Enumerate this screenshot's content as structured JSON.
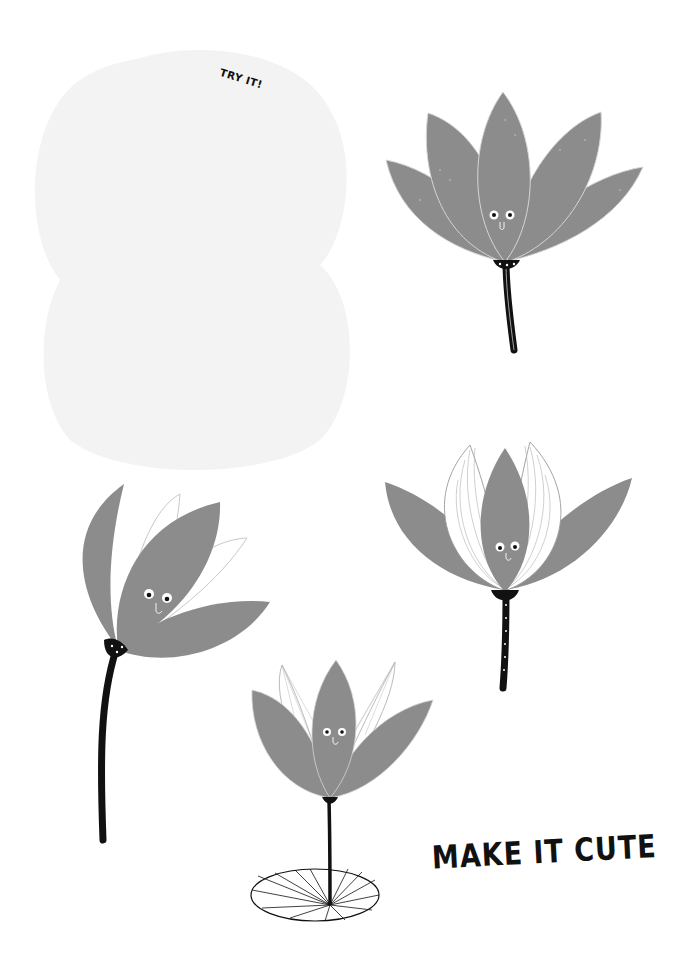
{
  "page": {
    "practice_area": {
      "label": "TRY IT!"
    },
    "caption": "MAKE IT CUTE",
    "colors": {
      "petal": "#8c8c8c",
      "petal_outline": "#d6d6d6",
      "ink": "#111111",
      "practice_fill": "#f3f3f3",
      "background": "#ffffff"
    },
    "flowers": [
      {
        "name": "open-lotus",
        "style": "fully open, six grey petals, smooth black stem"
      },
      {
        "name": "tilted-bud-lotus",
        "style": "tilted bud, white outlined petals, curved black stem"
      },
      {
        "name": "striped-lotus",
        "style": "striped white inner petals, polka-dot stem"
      },
      {
        "name": "lily-pad-lotus",
        "style": "lotus on thin stem above a lily pad"
      }
    ]
  }
}
